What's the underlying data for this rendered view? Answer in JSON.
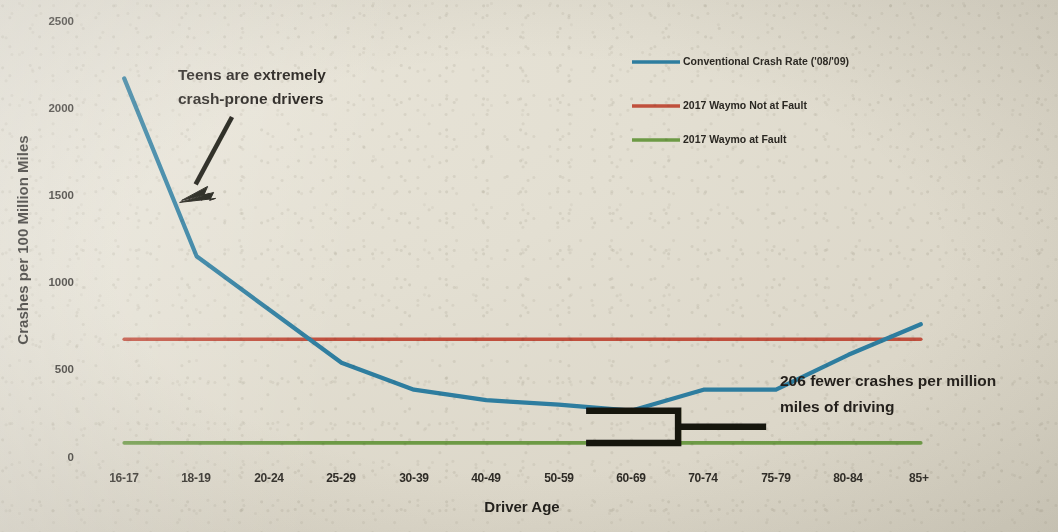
{
  "chart_data": {
    "type": "line",
    "title": "",
    "xlabel": "Driver Age",
    "ylabel": "Crashes per 100 Million Miles",
    "categories": [
      "16-17",
      "18-19",
      "20-24",
      "25-29",
      "30-39",
      "40-49",
      "50-59",
      "60-69",
      "70-74",
      "75-79",
      "80-84",
      "85+"
    ],
    "ylim": [
      0,
      2500
    ],
    "yticks": [
      0,
      500,
      1000,
      1500,
      2000,
      2500
    ],
    "ytick_labels": [
      "0",
      "500",
      "1000",
      "1500",
      "2000",
      "2500"
    ],
    "grid": false,
    "legend_position": "top-right",
    "series": [
      {
        "name": "Conventional Crash Rate ('08/'09)",
        "color": "#2d7d9f",
        "type": "line",
        "values": [
          2165,
          1145,
          840,
          535,
          380,
          320,
          295,
          260,
          380,
          380,
          580,
          755
        ]
      },
      {
        "name": "2017 Waymo Not at Fault",
        "color": "#c0503c",
        "type": "hline",
        "value": 670,
        "values": [
          670,
          670,
          670,
          670,
          670,
          670,
          670,
          670,
          670,
          670,
          670,
          670
        ]
      },
      {
        "name": "2017 Waymo at Fault",
        "color": "#6d9a45",
        "type": "hline",
        "value": 75,
        "values": [
          75,
          75,
          75,
          75,
          75,
          75,
          75,
          75,
          75,
          75,
          75,
          75
        ]
      }
    ],
    "annotations": [
      {
        "id": "teens-callout",
        "text_lines": [
          "Teens are extremely",
          "crash-prone drivers"
        ],
        "points_to": {
          "category": "18-19",
          "value": 1500
        }
      },
      {
        "id": "delta-callout",
        "text_lines": [
          "206 fewer crashes per million",
          "miles of driving"
        ],
        "delta": 206,
        "brackets": {
          "from_category": "60-69",
          "top_value": 260,
          "bottom_value": 75
        }
      }
    ]
  },
  "legend": {
    "items": [
      {
        "label": "Conventional Crash Rate ('08/'09)",
        "color": "#2d7d9f"
      },
      {
        "label": "2017 Waymo Not at Fault",
        "color": "#c0503c"
      },
      {
        "label": "2017 Waymo at Fault",
        "color": "#6d9a45"
      }
    ]
  },
  "axes": {
    "y_title": "Crashes per 100 Million Miles",
    "x_title": "Driver Age",
    "y_ticks": [
      "2500",
      "2000",
      "1500",
      "1000",
      "500",
      "0"
    ],
    "x_ticks": [
      "16-17",
      "18-19",
      "20-24",
      "25-29",
      "30-39",
      "40-49",
      "50-59",
      "60-69",
      "70-74",
      "75-79",
      "80-84",
      "85+"
    ]
  },
  "annotations": {
    "teens_line1": "Teens are extremely",
    "teens_line2": "crash-prone drivers",
    "delta_line1": "206 fewer crashes per million",
    "delta_line2": "miles of driving"
  },
  "colors": {
    "background": "#e3dfd2",
    "conventional": "#2d7d9f",
    "waymo_not_at_fault": "#c0503c",
    "waymo_at_fault": "#6d9a45",
    "axis": "#8f8c82",
    "text": "#231f1b"
  }
}
